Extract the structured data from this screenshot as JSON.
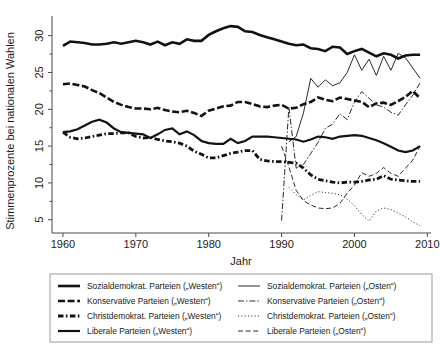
{
  "chart_data": {
    "type": "line",
    "title": "",
    "xlabel": "Jahr",
    "ylabel": "Stimmenprozente bei nationalen Wahlen",
    "xlim": [
      1958.5,
      2010.5
    ],
    "ylim": [
      3.2,
      32.4
    ],
    "xticks": [
      1960,
      1970,
      1980,
      1990,
      2000,
      2010
    ],
    "yticks": [
      5,
      10,
      15,
      20,
      25,
      30
    ],
    "grid": false,
    "legend_position": "below-center",
    "series": [
      {
        "name": "Sozialdemokrat. Parteien („Westen“)",
        "style": "solid",
        "width": 2.6,
        "dash": "",
        "x": [
          1960,
          1961,
          1962,
          1963,
          1964,
          1965,
          1966,
          1967,
          1968,
          1969,
          1970,
          1971,
          1972,
          1973,
          1974,
          1975,
          1976,
          1977,
          1978,
          1979,
          1980,
          1981,
          1982,
          1983,
          1984,
          1985,
          1986,
          1987,
          1988,
          1989,
          1990,
          1991,
          1992,
          1993,
          1994,
          1995,
          1996,
          1997,
          1998,
          1999,
          2000,
          2001,
          2002,
          2003,
          2004,
          2005,
          2006,
          2007,
          2008,
          2009
        ],
        "y": [
          28.6,
          29.2,
          29.1,
          29.0,
          28.8,
          28.8,
          28.9,
          29.1,
          28.9,
          29.1,
          29.3,
          29.1,
          28.8,
          29.2,
          28.7,
          29.1,
          28.9,
          29.5,
          29.3,
          29.3,
          30.1,
          30.6,
          31.0,
          31.3,
          31.2,
          30.6,
          30.5,
          30.1,
          29.8,
          29.5,
          29.2,
          28.9,
          28.7,
          28.8,
          28.3,
          28.2,
          27.9,
          28.5,
          28.4,
          27.5,
          27.9,
          28.2,
          27.7,
          27.2,
          27.6,
          27.4,
          26.9,
          27.3,
          27.4,
          27.4
        ]
      },
      {
        "name": "Konservative Parteien („Westen“)",
        "style": "dashed-thick",
        "width": 2.6,
        "dash": "7,2.6",
        "x": [
          1960,
          1961,
          1962,
          1963,
          1964,
          1965,
          1966,
          1967,
          1968,
          1969,
          1970,
          1971,
          1972,
          1973,
          1974,
          1975,
          1976,
          1977,
          1978,
          1979,
          1980,
          1981,
          1982,
          1983,
          1984,
          1985,
          1986,
          1987,
          1988,
          1989,
          1990,
          1991,
          1992,
          1993,
          1994,
          1995,
          1996,
          1997,
          1998,
          1999,
          2000,
          2001,
          2002,
          2003,
          2004,
          2005,
          2006,
          2007,
          2008,
          2009
        ],
        "y": [
          23.4,
          23.5,
          23.3,
          23.1,
          22.6,
          22.2,
          21.6,
          21.0,
          20.6,
          20.3,
          20.1,
          20.1,
          20.0,
          20.2,
          19.9,
          19.7,
          19.6,
          19.8,
          19.5,
          19.1,
          19.8,
          20.1,
          20.4,
          20.5,
          21.0,
          21.0,
          20.7,
          20.4,
          20.3,
          20.5,
          20.6,
          20.1,
          20.2,
          20.7,
          21.0,
          21.6,
          21.3,
          21.1,
          21.6,
          21.4,
          21.2,
          21.0,
          20.3,
          20.8,
          20.9,
          20.6,
          21.1,
          21.7,
          22.5,
          21.5
        ]
      },
      {
        "name": "Christdemokrat. Parteien („Westen“)",
        "style": "dash-dot-thick",
        "width": 2.8,
        "dash": "5.5,2.4,1.6,2.4",
        "x": [
          1960,
          1961,
          1962,
          1963,
          1964,
          1965,
          1966,
          1967,
          1968,
          1969,
          1970,
          1971,
          1972,
          1973,
          1974,
          1975,
          1976,
          1977,
          1978,
          1979,
          1980,
          1981,
          1982,
          1983,
          1984,
          1985,
          1986,
          1987,
          1988,
          1989,
          1990,
          1991,
          1992,
          1993,
          1994,
          1995,
          1996,
          1997,
          1998,
          1999,
          2000,
          2001,
          2002,
          2003,
          2004,
          2005,
          2006,
          2007,
          2008,
          2009
        ],
        "y": [
          16.9,
          16.2,
          16.0,
          16.1,
          16.3,
          16.5,
          16.7,
          16.7,
          16.8,
          16.8,
          16.3,
          16.1,
          16.2,
          15.9,
          15.7,
          15.6,
          15.4,
          15.0,
          14.3,
          13.9,
          13.4,
          13.4,
          13.7,
          14.0,
          14.2,
          14.4,
          14.4,
          13.2,
          13.0,
          12.9,
          12.9,
          12.8,
          12.7,
          12.0,
          11.1,
          10.5,
          10.3,
          10.1,
          10.0,
          10.1,
          10.1,
          10.2,
          10.4,
          10.5,
          11.0,
          10.5,
          10.4,
          10.3,
          10.2,
          10.2
        ]
      },
      {
        "name": "Liberale Parteien („Westen“)",
        "style": "solid-med",
        "width": 2.2,
        "dash": "",
        "x": [
          1960,
          1961,
          1962,
          1963,
          1964,
          1965,
          1966,
          1967,
          1968,
          1969,
          1970,
          1971,
          1972,
          1973,
          1974,
          1975,
          1976,
          1977,
          1978,
          1979,
          1980,
          1981,
          1982,
          1983,
          1984,
          1985,
          1986,
          1987,
          1988,
          1989,
          1990,
          1991,
          1992,
          1993,
          1994,
          1995,
          1996,
          1997,
          1998,
          1999,
          2000,
          2001,
          2002,
          2003,
          2004,
          2005,
          2006,
          2007,
          2008,
          2009
        ],
        "y": [
          16.9,
          17.0,
          17.3,
          17.8,
          18.3,
          18.6,
          18.2,
          17.4,
          16.9,
          16.8,
          16.7,
          16.6,
          16.1,
          16.6,
          17.2,
          17.4,
          16.6,
          17.0,
          16.5,
          15.7,
          15.4,
          15.3,
          15.3,
          16.0,
          15.4,
          15.7,
          16.3,
          16.3,
          16.3,
          16.2,
          16.1,
          16.0,
          15.9,
          15.6,
          15.9,
          16.3,
          16.2,
          16.0,
          16.3,
          16.4,
          16.5,
          16.4,
          16.1,
          15.8,
          15.4,
          14.9,
          14.4,
          14.2,
          14.4,
          15.0
        ]
      },
      {
        "name": "Sozialdemokrat. Parteien („Osten“)",
        "style": "solid-thin",
        "width": 0.9,
        "dash": "",
        "x": [
          1991,
          1992,
          1993,
          1994,
          1995,
          1996,
          1997,
          1998,
          1999,
          2000,
          2001,
          2002,
          2003,
          2004,
          2005,
          2006,
          2007,
          2008,
          2009
        ],
        "y": [
          15.6,
          16.3,
          19.5,
          24.2,
          23.0,
          24.0,
          23.2,
          23.6,
          25.0,
          27.4,
          25.3,
          26.8,
          24.6,
          27.2,
          25.3,
          27.6,
          27.0,
          25.6,
          24.2
        ]
      },
      {
        "name": "Konservative Parteien („Osten“)",
        "style": "dash-dot-thin",
        "width": 0.9,
        "dash": "6,2,1.4,2",
        "x": [
          1990,
          1991,
          1992,
          1993,
          1994,
          1995,
          1996,
          1997,
          1998,
          1999,
          2000,
          2001,
          2002,
          2003,
          2004,
          2005,
          2006,
          2007,
          2008,
          2009
        ],
        "y": [
          4.9,
          20.3,
          12.0,
          12.5,
          14.0,
          15.5,
          17.4,
          18.0,
          19.4,
          18.6,
          21.0,
          22.4,
          21.5,
          20.6,
          20.3,
          19.6,
          19.2,
          20.6,
          21.9,
          23.6
        ]
      },
      {
        "name": "Christdemokrat. Parteien („Osten“)",
        "style": "dotted-thin",
        "width": 0.9,
        "dash": "1.1,2.2",
        "x": [
          1991,
          1992,
          1993,
          1994,
          1995,
          1996,
          1997,
          1998,
          1999,
          2000,
          2001,
          2002,
          2003,
          2004,
          2005,
          2006,
          2007,
          2008,
          2009
        ],
        "y": [
          9.4,
          8.4,
          7.7,
          8.3,
          8.8,
          8.7,
          8.6,
          8.4,
          7.8,
          6.9,
          5.7,
          4.8,
          6.2,
          6.6,
          6.4,
          5.9,
          5.4,
          4.7,
          4.2
        ]
      },
      {
        "name": "Liberale Parteien („Osten“)",
        "style": "dashed-thin",
        "width": 0.9,
        "dash": "5,2.6",
        "x": [
          1990,
          1991,
          1992,
          1993,
          1994,
          1995,
          1996,
          1997,
          1998,
          1999,
          2000,
          2001,
          2002,
          2003,
          2004,
          2005,
          2006,
          2007,
          2008,
          2009
        ],
        "y": [
          15.0,
          12.2,
          9.0,
          7.6,
          7.0,
          6.6,
          6.5,
          6.6,
          7.2,
          8.6,
          9.7,
          11.4,
          10.9,
          11.3,
          12.1,
          11.3,
          10.9,
          12.0,
          13.1,
          15.0
        ]
      }
    ]
  },
  "legend": {
    "columns": [
      {
        "entries": [
          {
            "label": "Sozialdemokrat. Parteien („Westen“)",
            "key": "solid",
            "width": 2.6,
            "dash": ""
          },
          {
            "label": "Konservative Parteien („Westen“)",
            "key": "dashed-thick",
            "width": 2.6,
            "dash": "7,2.6"
          },
          {
            "label": "Christdemokrat. Parteien („Westen“)",
            "key": "dash-dot-thick",
            "width": 2.8,
            "dash": "5.5,2.4,1.6,2.4"
          },
          {
            "label": "Liberale Parteien („Westen“)",
            "key": "solid-med",
            "width": 2.2,
            "dash": ""
          }
        ]
      },
      {
        "entries": [
          {
            "label": "Sozialdemokrat. Parteien („Osten“)",
            "key": "solid-thin",
            "width": 0.9,
            "dash": ""
          },
          {
            "label": "Konservative Parteien („Osten“)",
            "key": "dash-dot-thin",
            "width": 0.9,
            "dash": "6,2,1.4,2"
          },
          {
            "label": "Christdemokrat. Parteien („Osten“)",
            "key": "dotted-thin",
            "width": 0.9,
            "dash": "1.1,2.2"
          },
          {
            "label": "Liberale Parteien („Osten“)",
            "key": "dashed-thin",
            "width": 0.9,
            "dash": "5,2.6"
          }
        ]
      }
    ]
  },
  "colors": {
    "ink": "#121212",
    "axis": "#4a4a4a",
    "legend_border": "#9a9a9a",
    "background": "#ffffff"
  }
}
